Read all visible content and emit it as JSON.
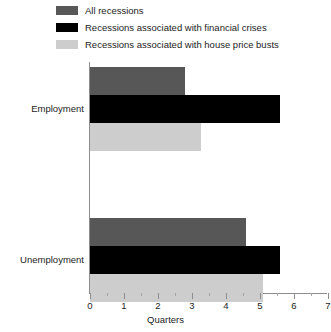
{
  "legend": {
    "items": [
      {
        "label": "All recessions",
        "color": "#575757",
        "key": "all"
      },
      {
        "label": "Recessions associated with financial crises",
        "color": "#000000",
        "key": "financial"
      },
      {
        "label": "Recessions associated with house price busts",
        "color": "#cdcdcd",
        "key": "house"
      }
    ]
  },
  "axis": {
    "xlabel": "Quarters",
    "ticks": [
      "0",
      "1",
      "2",
      "3",
      "4",
      "5",
      "6",
      "7"
    ]
  },
  "categories": [
    {
      "label": "Employment"
    },
    {
      "label": "Unemployment"
    }
  ],
  "chart_data": {
    "type": "bar",
    "orientation": "horizontal",
    "title": "",
    "xlabel": "Quarters",
    "ylabel": "",
    "xlim": [
      0,
      7
    ],
    "grid": false,
    "legend_position": "top-left",
    "categories": [
      "Employment",
      "Unemployment"
    ],
    "series": [
      {
        "name": "All recessions",
        "color": "#575757",
        "values": [
          2.8,
          4.6
        ]
      },
      {
        "name": "Recessions associated with financial crises",
        "color": "#000000",
        "values": [
          5.6,
          5.6
        ]
      },
      {
        "name": "Recessions associated with house price busts",
        "color": "#cdcdcd",
        "values": [
          3.25,
          5.1
        ]
      }
    ]
  },
  "geometry": {
    "x_origin_px": 90,
    "px_per_unit": 34,
    "bar_height_px": 28,
    "group_tops_px": [
      67,
      218
    ]
  }
}
